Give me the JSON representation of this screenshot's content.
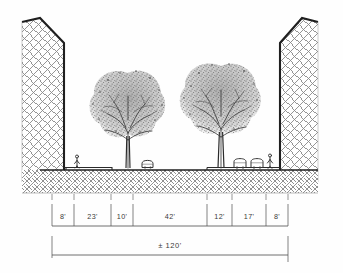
{
  "drawing": {
    "type": "street-section",
    "title_visible": false,
    "ink_color": "#2f2f2f",
    "paper_color": "#fefefe",
    "hatch_color": "#7b7b7b",
    "foliage_color": "#6d6d6d"
  },
  "dimensions": {
    "segments": [
      {
        "label": "8'",
        "value": 8,
        "x_start": 52,
        "x_end": 74
      },
      {
        "label": "23'",
        "value": 23,
        "x_start": 74,
        "x_end": 111
      },
      {
        "label": "10'",
        "value": 10,
        "x_start": 111,
        "x_end": 133
      },
      {
        "label": "42'",
        "value": 42,
        "x_start": 133,
        "x_end": 207
      },
      {
        "label": "12'",
        "value": 12,
        "x_start": 207,
        "x_end": 232
      },
      {
        "label": "17'",
        "value": 17,
        "x_start": 232,
        "x_end": 266
      },
      {
        "label": "8'",
        "value": 8,
        "x_start": 266,
        "x_end": 288
      }
    ],
    "total": {
      "label": "± 120'",
      "value": 120,
      "x_start": 52,
      "x_end": 288
    },
    "units": "feet"
  },
  "elements": {
    "building_left": "building-mass-left",
    "building_right": "building-mass-right",
    "tree_left": "street-tree-left",
    "tree_right": "street-tree-right",
    "pedestrian_left": "pedestrian-figure-left",
    "pedestrian_right": "pedestrian-figure-right",
    "car_center": "parked-car-center",
    "car_right_a": "parked-car-right-a",
    "car_right_b": "parked-car-right-b",
    "ground": "ground-hatch",
    "street_line": "street-grade-line"
  }
}
